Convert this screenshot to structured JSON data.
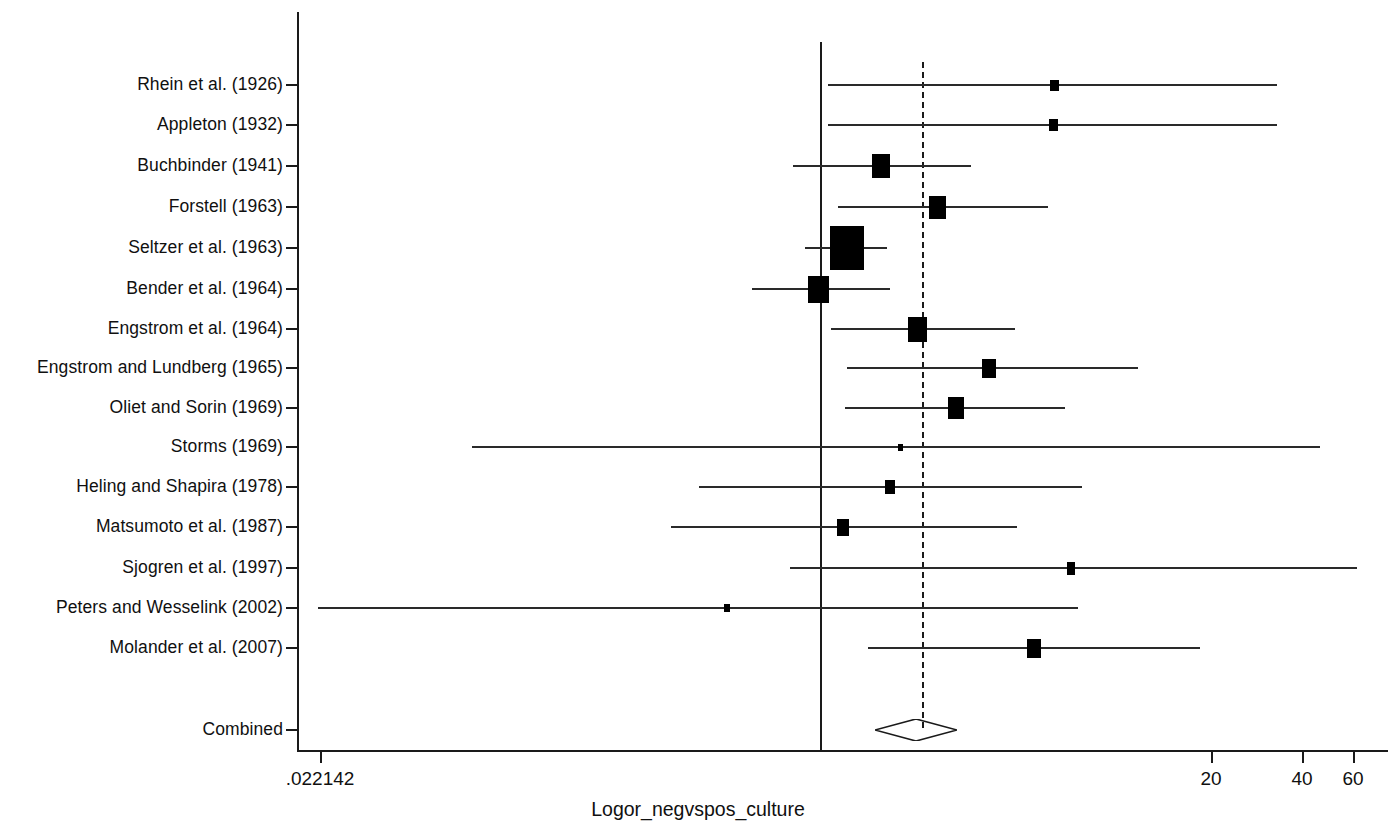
{
  "chart_data": {
    "type": "forest",
    "title": "",
    "xlabel": "Logor_negvspos_culture",
    "ylabel": "",
    "scale": "log",
    "grid": false,
    "legend": null,
    "xticks": [
      {
        "label": ".022142",
        "value": 0.022142,
        "px": 320
      },
      {
        "label": "20",
        "value": 20,
        "px": 1211
      },
      {
        "label": "40",
        "value": 40,
        "px": 1302
      },
      {
        "label": "60",
        "value": 60,
        "px": 1353
      }
    ],
    "null_line": {
      "label": "1",
      "value": 1,
      "px": 820
    },
    "pooled_line": {
      "label": "pooled estimate",
      "px": 922,
      "style": "dashed"
    },
    "combined": {
      "label": "Combined",
      "center_px": 916,
      "low_px": 875,
      "high_px": 957,
      "y_px": 730,
      "shape": "diamond"
    },
    "categories": [
      "Rhein et al. (1926)",
      "Appleton (1932)",
      "Buchbinder (1941)",
      "Forstell (1963)",
      "Seltzer et al. (1963)",
      "Bender et al. (1964)",
      "Engstrom et al. (1964)",
      "Engstrom and Lundberg (1965)",
      "Oliet and Sorin (1969)",
      "Storms (1969)",
      "Heling and Shapira (1978)",
      "Matsumoto et al. (1987)",
      "Sjogren et al. (1997)",
      "Peters and Wesselink (2002)",
      "Molander et al. (2007)"
    ],
    "studies": [
      {
        "label": "Rhein et al. (1926)",
        "y_px": 85,
        "est_px": 1054,
        "low_px": 828,
        "high_px": 1277,
        "box_w": 9,
        "box_h": 11
      },
      {
        "label": "Appleton (1932)",
        "y_px": 125,
        "est_px": 1053,
        "low_px": 828,
        "high_px": 1277,
        "box_w": 9,
        "box_h": 12
      },
      {
        "label": "Buchbinder (1941)",
        "y_px": 166,
        "est_px": 881,
        "low_px": 793,
        "high_px": 971,
        "box_w": 18,
        "box_h": 24
      },
      {
        "label": "Forstell (1963)",
        "y_px": 207,
        "est_px": 937,
        "low_px": 838,
        "high_px": 1048,
        "box_w": 17,
        "box_h": 23
      },
      {
        "label": "Seltzer et al. (1963)",
        "y_px": 248,
        "est_px": 847,
        "low_px": 805,
        "high_px": 887,
        "box_w": 34,
        "box_h": 44
      },
      {
        "label": "Bender et al. (1964)",
        "y_px": 289,
        "est_px": 818,
        "low_px": 752,
        "high_px": 890,
        "box_w": 21,
        "box_h": 27
      },
      {
        "label": "Engstrom et al. (1964)",
        "y_px": 329,
        "est_px": 917,
        "low_px": 831,
        "high_px": 1015,
        "box_w": 19,
        "box_h": 25
      },
      {
        "label": "Engstrom and Lundberg (1965)",
        "y_px": 368,
        "est_px": 989,
        "low_px": 847,
        "high_px": 1138,
        "box_w": 14,
        "box_h": 19
      },
      {
        "label": "Oliet and Sorin (1969)",
        "y_px": 408,
        "est_px": 956,
        "low_px": 845,
        "high_px": 1065,
        "box_w": 16,
        "box_h": 22
      },
      {
        "label": "Storms (1969)",
        "y_px": 447,
        "est_px": 900,
        "low_px": 472,
        "high_px": 1320,
        "box_w": 5,
        "box_h": 7
      },
      {
        "label": "Heling and Shapira (1978)",
        "y_px": 487,
        "est_px": 890,
        "low_px": 699,
        "high_px": 1082,
        "box_w": 10,
        "box_h": 14
      },
      {
        "label": "Matsumoto et al. (1987)",
        "y_px": 527,
        "est_px": 843,
        "low_px": 671,
        "high_px": 1017,
        "box_w": 12,
        "box_h": 17
      },
      {
        "label": "Sjogren et al. (1997)",
        "y_px": 568,
        "est_px": 1071,
        "low_px": 790,
        "high_px": 1357,
        "box_w": 8,
        "box_h": 13
      },
      {
        "label": "Peters and Wesselink (2002)",
        "y_px": 608,
        "est_px": 727,
        "low_px": 318,
        "high_px": 1078,
        "box_w": 6,
        "box_h": 8
      },
      {
        "label": "Molander et al. (2007)",
        "y_px": 648,
        "est_px": 1034,
        "low_px": 868,
        "high_px": 1200,
        "box_w": 14,
        "box_h": 19
      }
    ]
  },
  "axes": {
    "x_axis_title": "Logor_negvspos_culture",
    "y_axis_x_px": 297,
    "y_axis_top_px": 12,
    "y_axis_bottom_px": 750,
    "x_axis_y_px": 750,
    "x_axis_left_px": 297,
    "x_axis_right_px": 1388
  },
  "colors": {
    "ink": "#101010",
    "line": "#2a2a2a",
    "marker": "#000000",
    "background": "#ffffff"
  }
}
